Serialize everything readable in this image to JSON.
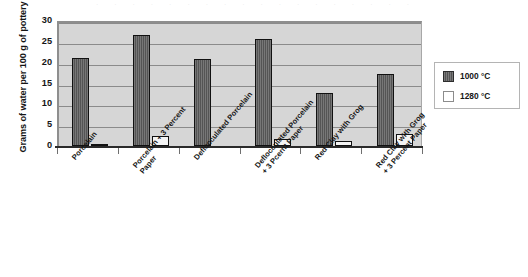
{
  "chart_data": {
    "type": "bar",
    "title": "",
    "xlabel": "",
    "ylabel": "Grams of water per 100 g of pottery",
    "ylim": [
      0,
      30
    ],
    "yticks": [
      0,
      5,
      10,
      15,
      20,
      25,
      30
    ],
    "ytick_labels": [
      "0",
      "5",
      "10",
      "15",
      "20",
      "25",
      "30"
    ],
    "grid": true,
    "legend_position": "right",
    "categories": [
      "Porcelain",
      "Porcelain + 3 Percent Paper",
      "Deflocculated Porcelain",
      "Deflocculated Porcelain + 3 Pcernt Paper",
      "Red Clay with Grog",
      "Red Clay with Grog + 3 Percent Paper"
    ],
    "category_lines": [
      [
        "Porcelain"
      ],
      [
        "Porcelain + 3 Percent",
        "Paper"
      ],
      [
        "Deflocculated Porcelain"
      ],
      [
        "Deflocculated Porcelain",
        "+ 3 Pcernt Paper"
      ],
      [
        "Red Clay with Grog"
      ],
      [
        "Red Clay with Grog",
        "+ 3 Percent Paper"
      ]
    ],
    "series": [
      {
        "name": "1000 °C",
        "color": "#5d5d5d",
        "values": [
          21.1,
          26.6,
          21.0,
          25.8,
          12.7,
          17.2
        ]
      },
      {
        "name": "1280 °C",
        "color": "#f4f4f4",
        "values": [
          0.3,
          2.3,
          0.0,
          1.8,
          1.1,
          2.8
        ]
      }
    ]
  },
  "legend": {
    "items": [
      {
        "label": "1000 °C",
        "swatch": "hot"
      },
      {
        "label": "1280 °C",
        "swatch": "cold"
      }
    ]
  },
  "scan_artifact": {
    "text": "·  ·  ·  ·  ·  ·  ·  ·  ·  ·  ·  ·  ·  ·  ·  ·  ·  ·"
  }
}
